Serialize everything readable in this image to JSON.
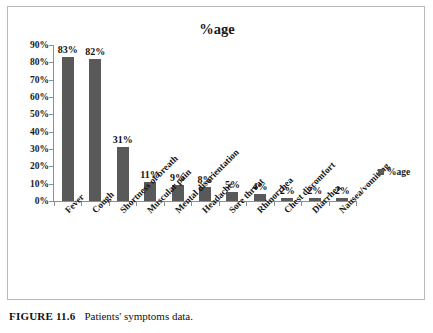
{
  "chart_data": {
    "type": "bar",
    "title": "%age",
    "xlabel": "",
    "ylabel": "",
    "ylim": [
      0,
      90
    ],
    "ytick_step": 10,
    "ytick_labels": [
      "0%",
      "10%",
      "20%",
      "30%",
      "40%",
      "50%",
      "60%",
      "70%",
      "80%",
      "90%"
    ],
    "ytick_values": [
      0,
      10,
      20,
      30,
      40,
      50,
      60,
      70,
      80,
      90
    ],
    "grid": false,
    "legend_position": "right",
    "legend": [
      "%age"
    ],
    "bar_color": "#595959",
    "axis_color": "#8d8d92",
    "categories": [
      "Fever",
      "Cough",
      "Shortness of breath",
      "Muscular pain",
      "Mental disorientation",
      "Headache",
      "Sore throat",
      "Rhinorrhea",
      "Chest discomfort",
      "Diarrhea",
      "Nausea/vomiting"
    ],
    "values": [
      83,
      82,
      31,
      11,
      9,
      8,
      5,
      4,
      2,
      2,
      2
    ],
    "data_labels": [
      "83%",
      "82%",
      "31%",
      "11%",
      "9%",
      "8%",
      "5%",
      "4%",
      "2%",
      "2%",
      "2%"
    ]
  },
  "legend": {
    "series_label": "%age",
    "swatch_color": "#595959"
  },
  "caption": {
    "figure_label": "FIGURE 11.6",
    "text": "Patients' symptoms data."
  }
}
